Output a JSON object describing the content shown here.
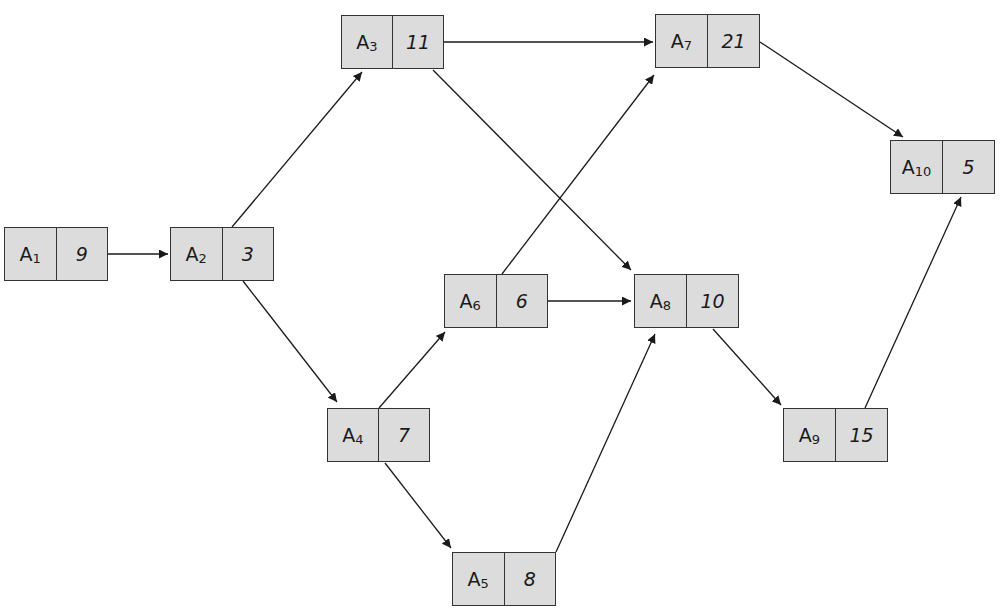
{
  "diagram": {
    "type": "activity-network",
    "nodes": [
      {
        "id": "A1",
        "label": "A",
        "sub": "1",
        "duration": "9",
        "x": 4,
        "y": 227,
        "w": 104
      },
      {
        "id": "A2",
        "label": "A",
        "sub": "2",
        "duration": "3",
        "x": 170,
        "y": 227,
        "w": 104
      },
      {
        "id": "A3",
        "label": "A",
        "sub": "3",
        "duration": "11",
        "x": 341,
        "y": 15,
        "w": 103
      },
      {
        "id": "A4",
        "label": "A",
        "sub": "4",
        "duration": "7",
        "x": 327,
        "y": 408,
        "w": 103
      },
      {
        "id": "A5",
        "label": "A",
        "sub": "5",
        "duration": "8",
        "x": 452,
        "y": 552,
        "w": 104
      },
      {
        "id": "A6",
        "label": "A",
        "sub": "6",
        "duration": "6",
        "x": 444,
        "y": 274,
        "w": 104
      },
      {
        "id": "A7",
        "label": "A",
        "sub": "7",
        "duration": "21",
        "x": 655,
        "y": 14,
        "w": 105
      },
      {
        "id": "A8",
        "label": "A",
        "sub": "8",
        "duration": "10",
        "x": 634,
        "y": 274,
        "w": 105
      },
      {
        "id": "A9",
        "label": "A",
        "sub": "9",
        "duration": "15",
        "x": 783,
        "y": 408,
        "w": 105
      },
      {
        "id": "A10",
        "label": "A",
        "sub": "10",
        "duration": "5",
        "x": 890,
        "y": 140,
        "w": 105
      }
    ],
    "edges": [
      {
        "from": "A1",
        "to": "A2",
        "x1": 108,
        "y1": 254,
        "x2": 168,
        "y2": 254
      },
      {
        "from": "A2",
        "to": "A3",
        "x1": 232,
        "y1": 227,
        "x2": 362,
        "y2": 72
      },
      {
        "from": "A2",
        "to": "A4",
        "x1": 243,
        "y1": 281,
        "x2": 337,
        "y2": 402
      },
      {
        "from": "A3",
        "to": "A7",
        "x1": 444,
        "y1": 42,
        "x2": 653,
        "y2": 42
      },
      {
        "from": "A3",
        "to": "A8",
        "x1": 433,
        "y1": 70,
        "x2": 631,
        "y2": 270
      },
      {
        "from": "A4",
        "to": "A6",
        "x1": 379,
        "y1": 408,
        "x2": 445,
        "y2": 332
      },
      {
        "from": "A4",
        "to": "A5",
        "x1": 385,
        "y1": 463,
        "x2": 451,
        "y2": 548
      },
      {
        "from": "A6",
        "to": "A7",
        "x1": 502,
        "y1": 274,
        "x2": 654,
        "y2": 75
      },
      {
        "from": "A6",
        "to": "A8",
        "x1": 548,
        "y1": 301,
        "x2": 631,
        "y2": 301
      },
      {
        "from": "A5",
        "to": "A8",
        "x1": 556,
        "y1": 552,
        "x2": 655,
        "y2": 334
      },
      {
        "from": "A8",
        "to": "A9",
        "x1": 713,
        "y1": 329,
        "x2": 781,
        "y2": 405
      },
      {
        "from": "A7",
        "to": "A10",
        "x1": 760,
        "y1": 42,
        "x2": 903,
        "y2": 137
      },
      {
        "from": "A9",
        "to": "A10",
        "x1": 865,
        "y1": 408,
        "x2": 961,
        "y2": 197
      }
    ],
    "colors": {
      "node_fill": "#dcdcdc",
      "stroke": "#333333",
      "text": "#1a1a1a",
      "background": "#ffffff"
    }
  }
}
